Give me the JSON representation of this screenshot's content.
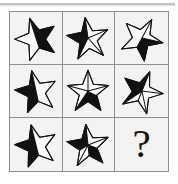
{
  "puzzle": {
    "type": "matrix-reasoning-3x3",
    "title": "Star shading matrix puzzle",
    "grid_rows": 3,
    "grid_columns": 3,
    "background_color": "#f4f3f1",
    "border_color": "#8e8e8e",
    "ink_color": "#111111",
    "paper_color": "#fbfbfa",
    "cells": [
      {
        "index": 1,
        "row": 1,
        "column": 1,
        "kind": "star",
        "points": 5,
        "rotation_deg": -18,
        "shading": "right-half-black",
        "label": "five-point star, right half filled black, left half white outline"
      },
      {
        "index": 2,
        "row": 1,
        "column": 2,
        "kind": "star",
        "points": 5,
        "rotation_deg": -8,
        "shading": "upper-left-black",
        "label": "five-point star, upper and left wedges filled black, lower right white"
      },
      {
        "index": 3,
        "row": 1,
        "column": 3,
        "kind": "star",
        "points": 5,
        "rotation_deg": 28,
        "shading": "lower-right-black",
        "label": "tilted five-point star, lower right wedge filled black"
      },
      {
        "index": 4,
        "row": 2,
        "column": 1,
        "kind": "star",
        "points": 5,
        "rotation_deg": -12,
        "shading": "left-half-black",
        "label": "five-point star, left half filled black, right half white outline"
      },
      {
        "index": 5,
        "row": 2,
        "column": 2,
        "kind": "star",
        "points": 5,
        "rotation_deg": 0,
        "shading": "bottom-right-black",
        "label": "upright five-point star, bottom right wedge filled black"
      },
      {
        "index": 6,
        "row": 2,
        "column": 3,
        "kind": "star",
        "points": 5,
        "rotation_deg": 22,
        "shading": "upper-left-black",
        "label": "tilted five-point star, upper left wedge filled black"
      },
      {
        "index": 7,
        "row": 3,
        "column": 1,
        "kind": "star",
        "points": 5,
        "rotation_deg": -14,
        "shading": "left-half-black",
        "label": "five-point star, left half filled black, right half white outline"
      },
      {
        "index": 8,
        "row": 3,
        "column": 2,
        "kind": "star",
        "points": 5,
        "rotation_deg": -6,
        "shading": "top-wedge-black",
        "label": "five-point star, top centre wedge filled black, lower arms white"
      },
      {
        "index": 9,
        "row": 3,
        "column": 3,
        "kind": "question",
        "label": "unknown answer cell",
        "text": "?"
      }
    ]
  }
}
